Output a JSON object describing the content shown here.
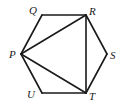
{
  "diagram": {
    "type": "geometry",
    "shape": "regular hexagon with inscribed triangle",
    "vertices": [
      {
        "name": "P",
        "x": 21,
        "y": 54,
        "label_x": 9,
        "label_y": 58
      },
      {
        "name": "Q",
        "x": 42,
        "y": 15,
        "label_x": 29,
        "label_y": 14
      },
      {
        "name": "R",
        "x": 86,
        "y": 15,
        "label_x": 89,
        "label_y": 15
      },
      {
        "name": "S",
        "x": 107,
        "y": 54,
        "label_x": 110,
        "label_y": 59
      },
      {
        "name": "T",
        "x": 86,
        "y": 93,
        "label_x": 89,
        "label_y": 100
      },
      {
        "name": "U",
        "x": 42,
        "y": 93,
        "label_x": 27,
        "label_y": 98
      }
    ],
    "hexagon_edges": [
      [
        "P",
        "Q"
      ],
      [
        "Q",
        "R"
      ],
      [
        "R",
        "S"
      ],
      [
        "S",
        "T"
      ],
      [
        "T",
        "U"
      ],
      [
        "U",
        "P"
      ]
    ],
    "diagonals": [
      [
        "P",
        "R"
      ],
      [
        "R",
        "T"
      ],
      [
        "P",
        "T"
      ]
    ],
    "labels": {
      "P": "P",
      "Q": "Q",
      "R": "R",
      "S": "S",
      "T": "T",
      "U": "U"
    }
  }
}
